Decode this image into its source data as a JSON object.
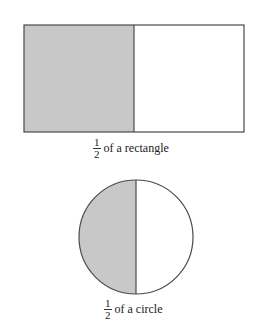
{
  "colors": {
    "shaded": "#c8c8c8",
    "stroke": "#4a4a4a",
    "background": "#ffffff"
  },
  "rectangle": {
    "fraction": {
      "numerator": "1",
      "denominator": "2"
    },
    "caption": "of a rectangle"
  },
  "circle": {
    "fraction": {
      "numerator": "1",
      "denominator": "2"
    },
    "caption": "of a circle"
  }
}
